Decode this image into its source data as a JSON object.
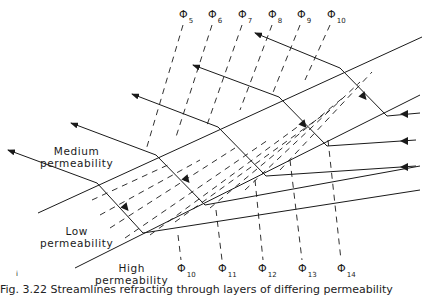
{
  "diagram": {
    "labels": {
      "medium": [
        "Medium",
        "permeability"
      ],
      "low": [
        "Low",
        "permeability"
      ],
      "high": [
        "High",
        "permeability"
      ]
    },
    "phi_top": [
      {
        "symbol": "Φ",
        "index": "5"
      },
      {
        "symbol": "Φ",
        "index": "6"
      },
      {
        "symbol": "Φ",
        "index": "7"
      },
      {
        "symbol": "Φ",
        "index": "8"
      },
      {
        "symbol": "Φ",
        "index": "9"
      },
      {
        "symbol": "Φ",
        "index": "10"
      }
    ],
    "phi_bottom": [
      {
        "symbol": "Φ",
        "index": "10"
      },
      {
        "symbol": "Φ",
        "index": "11"
      },
      {
        "symbol": "Φ",
        "index": "12"
      },
      {
        "symbol": "Φ",
        "index": "13"
      },
      {
        "symbol": "Φ",
        "index": "14"
      }
    ],
    "small_mark": "i",
    "caption": "Fig. 3.22  Streamlines refracting through layers of differing permeability"
  }
}
